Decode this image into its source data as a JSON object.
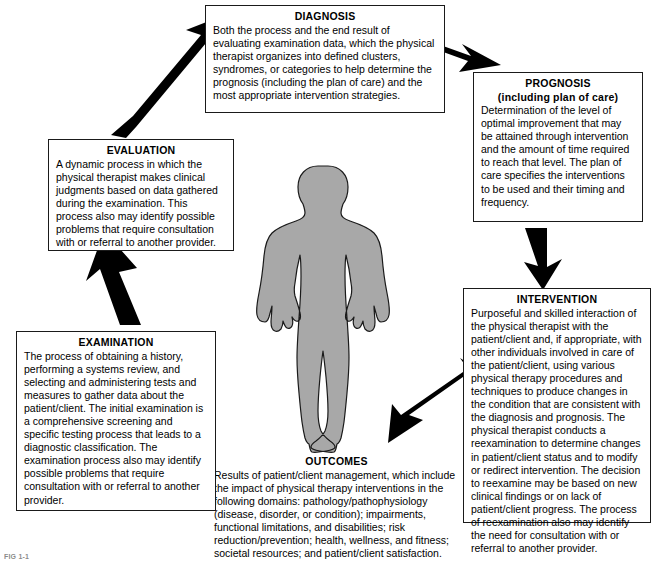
{
  "diagram": {
    "type": "cycle-flow-diagram",
    "title_caption": "FIG 1-1",
    "colors": {
      "body_figure_fill": "#a8a8a8",
      "body_figure_stroke": "#1a1a1a",
      "arrow_fill": "#000000",
      "box_border": "#1a1a1a",
      "background": "#ffffff"
    },
    "center_figure": {
      "name": "human-body-silhouette",
      "label": "patient/client body figure"
    },
    "nodes": [
      {
        "id": "diagnosis",
        "title": "DIAGNOSIS",
        "subtitle": "",
        "body": "Both the process and the end result of evaluating examination data, which the physical therapist organizes into defined clusters, syndromes, or categories to help determine the prognosis (including the plan of care) and the most appropriate intervention strategies.",
        "boxed": true
      },
      {
        "id": "prognosis",
        "title": "PROGNOSIS",
        "subtitle": "(including plan of care)",
        "body": "Determination of the level of optimal improvement that may be attained through intervention and the amount of time required to reach that level. The plan of care specifies the interventions to be used and their timing and frequency.",
        "boxed": true
      },
      {
        "id": "intervention",
        "title": "INTERVENTION",
        "subtitle": "",
        "body": "Purposeful and skilled interaction of the physical therapist with the patient/client and, if appropriate, with other individuals involved in care of the patient/client, using various physical therapy procedures and techniques to produce changes in the condition that are consistent with the diagnosis and prognosis. The physical therapist conducts a reexamination to determine changes in patient/client status and to modify or redirect intervention. The decision to reexamine may be based on new clinical findings or on lack of patient/client progress. The process of reexamination also may identify the need for consultation with or referral to another provider.",
        "boxed": true
      },
      {
        "id": "outcomes",
        "title": "OUTCOMES",
        "subtitle": "",
        "body": "Results of patient/client management, which include the impact of physical therapy interventions in the following domains: pathology/pathophysiology (disease, disorder, or condition); impairments, functional limitations, and disabilities; risk reduction/prevention; health, wellness, and fitness; societal resources; and patient/client satisfaction.",
        "boxed": false
      },
      {
        "id": "examination",
        "title": "EXAMINATION",
        "subtitle": "",
        "body": "The process of obtaining a history, performing a systems review, and selecting and administering tests and measures to gather data about the patient/client. The initial examination is a comprehensive screening and specific testing process that leads to a diagnostic classification. The examination process also may identify possible problems that require consultation with or referral to another provider.",
        "boxed": true
      },
      {
        "id": "evaluation",
        "title": "EVALUATION",
        "subtitle": "",
        "body": "A dynamic process in which the physical therapist makes clinical judgments based on data gathered during the examination. This process also may identify possible problems that require consultation with or referral to another provider.",
        "boxed": true
      }
    ],
    "arrows": [
      {
        "id": "arrow-examination-to-evaluation",
        "from": "examination",
        "to": "evaluation",
        "direction": "up"
      },
      {
        "id": "arrow-evaluation-to-diagnosis",
        "from": "evaluation",
        "to": "diagnosis",
        "direction": "up-right"
      },
      {
        "id": "arrow-diagnosis-to-prognosis",
        "from": "diagnosis",
        "to": "prognosis",
        "direction": "down-right"
      },
      {
        "id": "arrow-prognosis-to-intervention",
        "from": "prognosis",
        "to": "intervention",
        "direction": "down"
      },
      {
        "id": "arrow-intervention-to-outcomes",
        "from": "intervention",
        "to": "outcomes",
        "direction": "down-left"
      }
    ]
  }
}
